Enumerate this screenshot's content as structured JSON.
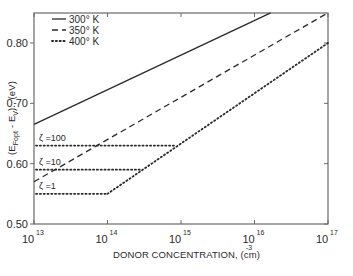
{
  "chart_data": {
    "type": "line",
    "title": "",
    "xlabel": "DONOR CONCENTRATION, (cm)",
    "xlabel_exponent": "-3",
    "ylabel": "(E_Fopt - E_V) , (eV)",
    "xscale": "log",
    "xlim_log10": [
      13,
      17
    ],
    "ylim": [
      0.5,
      0.85
    ],
    "grid": false,
    "legend_position": "upper left",
    "x_ticks": [
      {
        "base": "10",
        "exp": "13",
        "log": 13
      },
      {
        "base": "10",
        "exp": "14",
        "log": 14
      },
      {
        "base": "10",
        "exp": "15",
        "log": 15
      },
      {
        "base": "10",
        "exp": "16",
        "log": 16
      },
      {
        "base": "10",
        "exp": "17",
        "log": 17
      }
    ],
    "y_ticks": [
      {
        "label": "0.50",
        "value": 0.5
      },
      {
        "label": "0.60",
        "value": 0.6
      },
      {
        "label": "0.70",
        "value": 0.7
      },
      {
        "label": "0.80",
        "value": 0.8
      }
    ],
    "series": [
      {
        "name": "300° K",
        "style": "solid",
        "x_log10": [
          13,
          16.22
        ],
        "y": [
          0.665,
          0.85
        ]
      },
      {
        "name": "350° K",
        "style": "dashed",
        "x_log10": [
          13,
          17
        ],
        "y": [
          0.57,
          0.85
        ]
      },
      {
        "name": "400° K",
        "style": "dotted",
        "x_log10": [
          14,
          17
        ],
        "y": [
          0.55,
          0.8
        ]
      }
    ],
    "annotations": [
      {
        "label": "ζ =100",
        "style": "dotted",
        "y": 0.63,
        "x_log10_start": 13,
        "x_log10_end": 14.92
      },
      {
        "label": "ζ =10",
        "style": "dotted",
        "y": 0.59,
        "x_log10_start": 13,
        "x_log10_end": 14.44
      },
      {
        "label": "ζ =1",
        "style": "dotted",
        "y": 0.55,
        "x_log10_start": 13,
        "x_log10_end": 14.0
      }
    ]
  },
  "legend": [
    {
      "label": "300° K",
      "style": "solid"
    },
    {
      "label": "350° K",
      "style": "dashed"
    },
    {
      "label": "400° K",
      "style": "dotted"
    }
  ],
  "colors": {
    "ink": "#2a2a2a",
    "axis": "#6a6a6a",
    "background": "#ffffff"
  }
}
